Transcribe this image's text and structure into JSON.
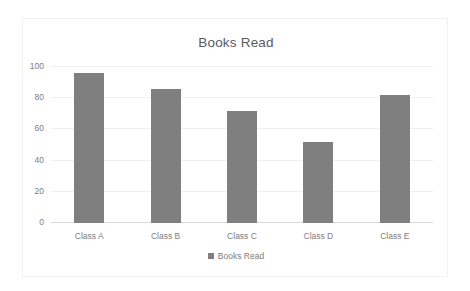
{
  "chart_data": {
    "type": "bar",
    "title": "Books Read",
    "xlabel": "",
    "ylabel": "",
    "categories": [
      "Class A",
      "Class B",
      "Class C",
      "Class D",
      "Class E"
    ],
    "values": [
      96,
      86,
      72,
      52,
      82
    ],
    "series": [
      {
        "name": "Books Read",
        "values": [
          96,
          86,
          72,
          52,
          82
        ],
        "color": "#7f7f7f"
      }
    ],
    "ylim": [
      0,
      100
    ],
    "yticks": [
      0,
      20,
      40,
      60,
      80,
      100
    ],
    "ytick_labels": [
      "0",
      "20",
      "40",
      "60",
      "80",
      "100"
    ],
    "grid": true,
    "grid_axis": "y",
    "legend": {
      "position": "bottom",
      "entries": [
        {
          "label": "Books Read",
          "color": "#7f7f7f",
          "marker": "square-swatch"
        }
      ]
    },
    "colors": {
      "bar": "#7f7f7f",
      "gridline": "#f0f0f0",
      "axis": "#d9d9d9",
      "text": "#7d7d7d",
      "title_text": "#5a5a5a",
      "plot_background": "#ffffff",
      "frame_border": "#f2f2f2"
    }
  }
}
